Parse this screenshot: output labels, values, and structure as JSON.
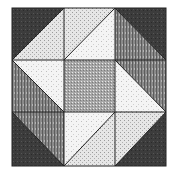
{
  "figure": {
    "title": "",
    "grid": "3x3",
    "colors": {
      "background": "#ffffff",
      "dark": "#3a3a3a",
      "striped": "#7a7a7a",
      "medium_speckle": "#9a9a9a",
      "light_speckle": "#d8d8d8",
      "very_light": "#f2f2f2",
      "line": "#222222"
    }
  }
}
